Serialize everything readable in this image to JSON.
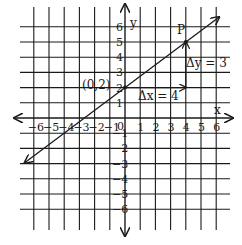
{
  "figure": {
    "type": "coordinate-graph",
    "grid": {
      "x_min": -6,
      "x_max": 6,
      "y_min": -6,
      "y_max": 6,
      "step": 1
    },
    "axes": {
      "x_label": "x",
      "y_label": "y",
      "origin_label": "0"
    },
    "x_tick_labels": [
      "-6",
      "-5",
      "-4",
      "-3",
      "-2",
      "-1",
      "1",
      "2",
      "3",
      "4",
      "5",
      "6"
    ],
    "y_tick_labels": [
      "6",
      "5",
      "4",
      "3",
      "2",
      "1",
      "-1",
      "-2",
      "-3",
      "-4",
      "-5",
      "-6"
    ],
    "line": {
      "slope": "3/4",
      "y_intercept": 2,
      "description": "line through (0,2) and P(4,5), arrows both ends"
    },
    "points": [
      {
        "label": "(0,2)",
        "x": 0,
        "y": 2
      },
      {
        "label": "P",
        "x": 4,
        "y": 5
      }
    ],
    "annotations": {
      "delta_x": "Δx = 4",
      "delta_y": "Δy = 3"
    },
    "colors": {
      "ink": "#1a1a1a",
      "background": "#ffffff"
    }
  }
}
